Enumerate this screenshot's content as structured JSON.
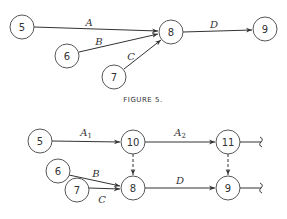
{
  "figure5": {
    "caption": "FIGURE 5.",
    "nodes": [
      {
        "id": "5",
        "x": 22,
        "y": 27
      },
      {
        "id": "6",
        "x": 67,
        "y": 56
      },
      {
        "id": "7",
        "x": 114,
        "y": 77
      },
      {
        "id": "8",
        "x": 171,
        "y": 32
      },
      {
        "id": "9",
        "x": 265,
        "y": 29
      }
    ],
    "edges": [
      {
        "from": "5",
        "to": "8",
        "label": "A"
      },
      {
        "from": "6",
        "to": "8",
        "label": "B"
      },
      {
        "from": "7",
        "to": "8",
        "label": "C"
      },
      {
        "from": "8",
        "to": "9",
        "label": "D"
      }
    ]
  },
  "figure6": {
    "nodes": [
      {
        "id": "5",
        "x": 40,
        "y": 141
      },
      {
        "id": "10",
        "x": 133,
        "y": 142
      },
      {
        "id": "11",
        "x": 228,
        "y": 142
      },
      {
        "id": "6",
        "x": 58,
        "y": 171
      },
      {
        "id": "7",
        "x": 77,
        "y": 190
      },
      {
        "id": "8",
        "x": 133,
        "y": 188
      },
      {
        "id": "9",
        "x": 228,
        "y": 188
      }
    ],
    "edges": [
      {
        "from": "5",
        "to": "10",
        "label": "A",
        "sub": "1"
      },
      {
        "from": "10",
        "to": "11",
        "label": "A",
        "sub": "2"
      },
      {
        "from": "6",
        "to": "8",
        "label": "B"
      },
      {
        "from": "7",
        "to": "8",
        "label": "C"
      },
      {
        "from": "8",
        "to": "9",
        "label": "D"
      },
      {
        "from": "10",
        "to": "8",
        "label": "",
        "dummy": true
      },
      {
        "from": "11",
        "to": "9",
        "label": "",
        "dummy": true
      }
    ]
  }
}
